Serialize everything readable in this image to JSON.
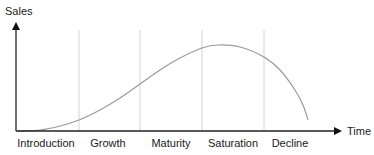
{
  "chart_data": {
    "type": "line",
    "title": "",
    "xlabel": "Time",
    "ylabel": "Sales",
    "grid": false,
    "legend": null,
    "stages": [
      "Introduction",
      "Growth",
      "Maturity",
      "Saturation",
      "Decline"
    ],
    "stage_dividers_px": [
      79,
      140,
      202,
      264
    ],
    "curve_description": "Product life cycle S-curve: starts near zero in Introduction, rises through Growth and Maturity, peaks in Saturation, falls sharply in Decline",
    "curve_points_px": [
      [
        18,
        131
      ],
      [
        40,
        130
      ],
      [
        60,
        126
      ],
      [
        79,
        120
      ],
      [
        100,
        110
      ],
      [
        120,
        98
      ],
      [
        140,
        84
      ],
      [
        160,
        70
      ],
      [
        180,
        58
      ],
      [
        202,
        48
      ],
      [
        218,
        45
      ],
      [
        240,
        47
      ],
      [
        264,
        57
      ],
      [
        280,
        70
      ],
      [
        295,
        90
      ],
      [
        303,
        105
      ],
      [
        308,
        120
      ]
    ],
    "axes": {
      "x_axis": {
        "x1": 16,
        "y": 131,
        "x2": 342
      },
      "y_axis": {
        "x": 16,
        "y1": 131,
        "y2": 22
      }
    }
  },
  "labels": {
    "y_axis": "Sales",
    "x_axis": "Time",
    "stages": [
      "Introduction",
      "Growth",
      "Maturity",
      "Saturation",
      "Decline"
    ]
  },
  "colors": {
    "axis": "#222222",
    "divider": "#d4d4d4",
    "curve": "#9a9a9a",
    "text": "#1a1a1a"
  }
}
